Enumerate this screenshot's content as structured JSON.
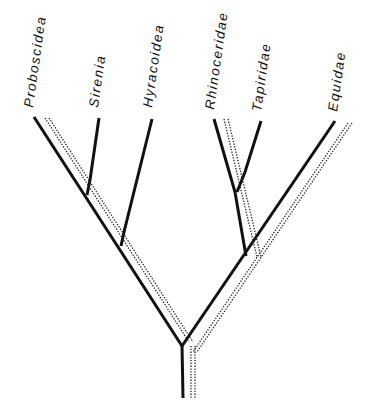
{
  "diagram": {
    "type": "cladogram",
    "colors": {
      "line": "#111111",
      "background": "#ffffff"
    },
    "taxa": [
      {
        "id": "proboscidea",
        "label": "Proboscidea"
      },
      {
        "id": "sirenia",
        "label": "Sirenia"
      },
      {
        "id": "hyracoidea",
        "label": "Hyracoidea"
      },
      {
        "id": "rhinoceridae",
        "label": "Rhinoceridae"
      },
      {
        "id": "tapiridae",
        "label": "Tapiridae"
      },
      {
        "id": "equidae",
        "label": "Equidae"
      }
    ],
    "line_styles": [
      "solid-branch",
      "dotted-double-track"
    ]
  }
}
